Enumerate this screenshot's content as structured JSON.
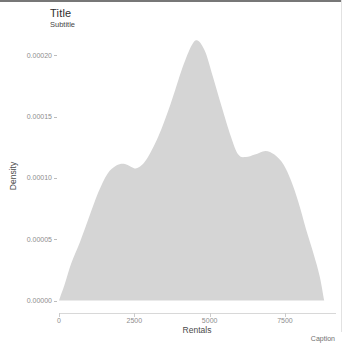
{
  "page": {
    "background": "#ffffff",
    "top_border_color": "#777777",
    "right_border_color": "#e2e2e2"
  },
  "header": {
    "title": "Title",
    "subtitle": "Subtitle"
  },
  "caption_text": "Caption",
  "chart_data": {
    "type": "area",
    "title": "Title",
    "subtitle": "Subtitle",
    "caption": "Caption",
    "xlabel": "Rentals",
    "ylabel": "Density",
    "xlim": [
      0,
      9200
    ],
    "ylim": [
      0,
      0.000225
    ],
    "grid": "off",
    "legend": "none",
    "fill_color": "#d5d5d5",
    "x_ticks": [
      {
        "label": "0",
        "value": 0
      },
      {
        "label": "2500",
        "value": 2500
      },
      {
        "label": "5000",
        "value": 5000
      },
      {
        "label": "7500",
        "value": 7500
      }
    ],
    "y_ticks": [
      {
        "label": "0.00020",
        "value": 0.0002
      },
      {
        "label": "0.00015",
        "value": 0.00015
      },
      {
        "label": "0.00010",
        "value": 0.0001
      },
      {
        "label": "0.00005",
        "value": 5e-05
      },
      {
        "label": "0.00000",
        "value": 0.0
      }
    ],
    "series_name": "density of rentals",
    "points": [
      [
        0,
        0
      ],
      [
        200,
        1.4e-05
      ],
      [
        400,
        3e-05
      ],
      [
        700,
        4.8e-05
      ],
      [
        1000,
        6.8e-05
      ],
      [
        1300,
        8.8e-05
      ],
      [
        1600,
        0.000103
      ],
      [
        1900,
        0.00011
      ],
      [
        2150,
        0.0001115
      ],
      [
        2400,
        0.000109
      ],
      [
        2600,
        0.000108
      ],
      [
        2900,
        0.000115
      ],
      [
        3300,
        0.000134
      ],
      [
        3700,
        0.00016
      ],
      [
        4100,
        0.00019
      ],
      [
        4400,
        0.000208
      ],
      [
        4600,
        0.000212
      ],
      [
        4850,
        0.000203
      ],
      [
        5100,
        0.000183
      ],
      [
        5400,
        0.000158
      ],
      [
        5700,
        0.000134
      ],
      [
        5950,
        0.000119
      ],
      [
        6200,
        0.000117
      ],
      [
        6500,
        0.000119
      ],
      [
        6850,
        0.000122
      ],
      [
        7150,
        0.000119
      ],
      [
        7450,
        0.000111
      ],
      [
        7700,
        9.8e-05
      ],
      [
        7950,
        8e-05
      ],
      [
        8200,
        5.8e-05
      ],
      [
        8450,
        3.8e-05
      ],
      [
        8650,
        2e-05
      ],
      [
        8800,
        0
      ]
    ]
  }
}
